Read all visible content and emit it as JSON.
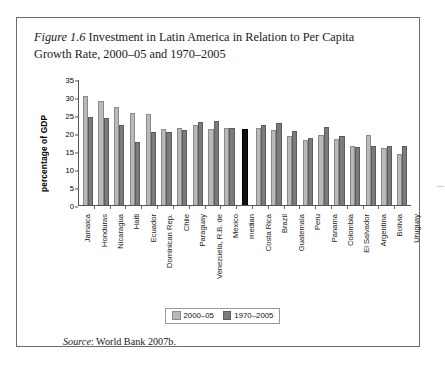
{
  "figure": {
    "label": "Figure 1.6",
    "caption": " Investment in Latin America in Relation to Per Capita Growth Rate, 2000–05 and 1970–2005",
    "source_prefix": "Source",
    "source_text": ": World Bank 2007b."
  },
  "legend": {
    "position": "bottom-center",
    "items": [
      {
        "label": "2000–05",
        "color": "#b9b9b9"
      },
      {
        "label": "1970–2005",
        "color": "#7b7b7b"
      }
    ]
  },
  "colors": {
    "series_2000_05": "#b9b9b9",
    "series_1970_2005": "#7b7b7b",
    "median_bar": "#111111",
    "axis": "#555555",
    "frame": "#6d6d6d"
  },
  "chart_data": {
    "type": "bar",
    "title": "Investment in Latin America in Relation to Per Capita Growth Rate, 2000–05 and 1970–2005",
    "xlabel": "",
    "ylabel": "percentage of GDP",
    "ylim": [
      0,
      35
    ],
    "yticks": [
      0,
      5,
      10,
      15,
      20,
      25,
      30,
      35
    ],
    "grid": false,
    "legend_position": "bottom-center",
    "categories": [
      "Jamaica",
      "Honduras",
      "Nicaragua",
      "Haiti",
      "Ecuador",
      "Dominican Rep.",
      "Chile",
      "Paraguay",
      "Venezuela, R.B. de",
      "Mexico",
      "median",
      "Costa Rica",
      "Brazil",
      "Guatemala",
      "Peru",
      "Panama",
      "Colombia",
      "El Salvador",
      "Argentina",
      "Bolivia",
      "Uruguay"
    ],
    "series": [
      {
        "name": "2000–05",
        "color": "#b9b9b9",
        "values": [
          30.2,
          29.0,
          27.2,
          25.5,
          25.3,
          21.0,
          21.5,
          22.2,
          21.0,
          21.5,
          null,
          21.5,
          20.7,
          19.3,
          18.0,
          19.5,
          18.3,
          16.3,
          19.5,
          15.7,
          14.3
        ]
      },
      {
        "name": "1970–2005",
        "color": "#7b7b7b",
        "values": [
          24.5,
          24.2,
          22.2,
          17.5,
          20.2,
          20.2,
          20.7,
          23.0,
          23.3,
          21.5,
          null,
          22.3,
          22.8,
          20.5,
          18.7,
          21.8,
          19.3,
          16.0,
          16.3,
          16.5,
          16.3
        ]
      },
      {
        "name": "median",
        "color": "#111111",
        "values": [
          null,
          null,
          null,
          null,
          null,
          null,
          null,
          null,
          null,
          null,
          21.2,
          null,
          null,
          null,
          null,
          null,
          null,
          null,
          null,
          null,
          null
        ]
      }
    ]
  }
}
